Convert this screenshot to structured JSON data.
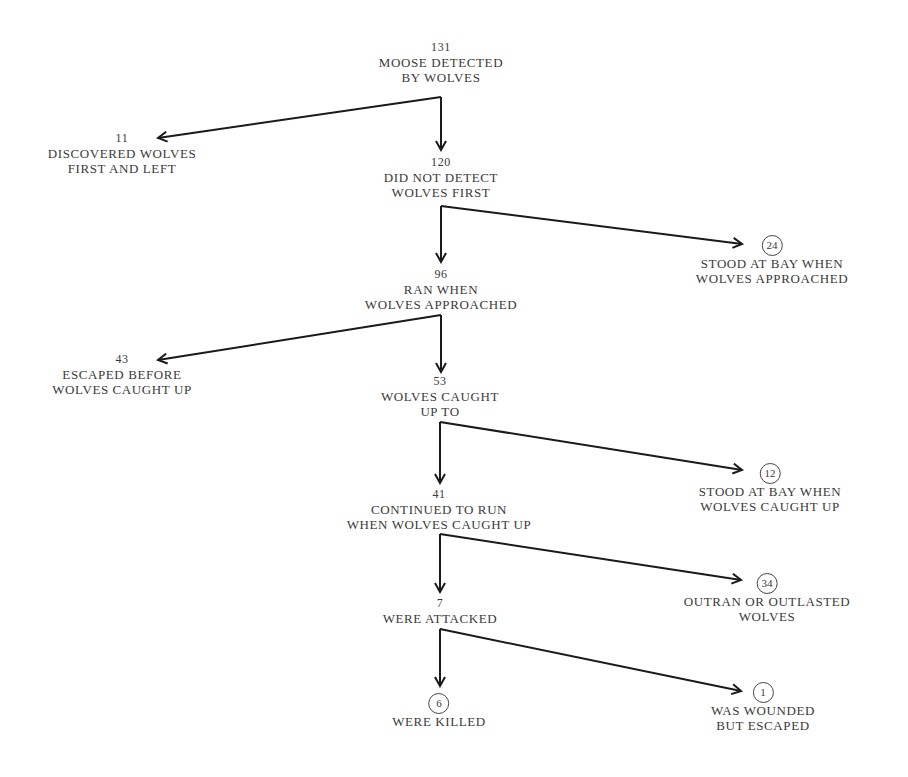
{
  "diagram": {
    "nodes": [
      {
        "id": "root",
        "count": "131",
        "lines": [
          "MOOSE DETECTED",
          "BY WOLVES"
        ],
        "terminal": false
      },
      {
        "id": "left1",
        "count": "11",
        "lines": [
          "DISCOVERED WOLVES",
          "FIRST AND LEFT"
        ],
        "terminal": false
      },
      {
        "id": "n120",
        "count": "120",
        "lines": [
          "DID NOT DETECT",
          "WOLVES FIRST"
        ],
        "terminal": false
      },
      {
        "id": "r24",
        "count": "24",
        "lines": [
          "STOOD AT BAY WHEN",
          "WOLVES APPROACHED"
        ],
        "terminal": true
      },
      {
        "id": "n96",
        "count": "96",
        "lines": [
          "RAN WHEN",
          "WOLVES APPROACHED"
        ],
        "terminal": false
      },
      {
        "id": "left43",
        "count": "43",
        "lines": [
          "ESCAPED BEFORE",
          "WOLVES CAUGHT UP"
        ],
        "terminal": false
      },
      {
        "id": "n53",
        "count": "53",
        "lines": [
          "WOLVES CAUGHT",
          "UP TO"
        ],
        "terminal": false
      },
      {
        "id": "r12",
        "count": "12",
        "lines": [
          "STOOD AT BAY WHEN",
          "WOLVES CAUGHT UP"
        ],
        "terminal": true
      },
      {
        "id": "n41",
        "count": "41",
        "lines": [
          "CONTINUED TO RUN",
          "WHEN WOLVES CAUGHT UP"
        ],
        "terminal": false
      },
      {
        "id": "r34",
        "count": "34",
        "lines": [
          "OUTRAN OR OUTLASTED",
          "WOLVES"
        ],
        "terminal": true
      },
      {
        "id": "n7",
        "count": "7",
        "lines": [
          "WERE ATTACKED"
        ],
        "terminal": false
      },
      {
        "id": "k6",
        "count": "6",
        "lines": [
          "WERE KILLED"
        ],
        "terminal": true
      },
      {
        "id": "r1",
        "count": "1",
        "lines": [
          "WAS WOUNDED",
          "BUT ESCAPED"
        ],
        "terminal": true
      }
    ],
    "edges": [
      {
        "from": "root",
        "to": "left1"
      },
      {
        "from": "root",
        "to": "n120"
      },
      {
        "from": "n120",
        "to": "n96"
      },
      {
        "from": "n120",
        "to": "r24"
      },
      {
        "from": "n96",
        "to": "left43"
      },
      {
        "from": "n96",
        "to": "n53"
      },
      {
        "from": "n53",
        "to": "n41"
      },
      {
        "from": "n53",
        "to": "r12"
      },
      {
        "from": "n41",
        "to": "n7"
      },
      {
        "from": "n41",
        "to": "r34"
      },
      {
        "from": "n7",
        "to": "k6"
      },
      {
        "from": "n7",
        "to": "r1"
      }
    ]
  }
}
